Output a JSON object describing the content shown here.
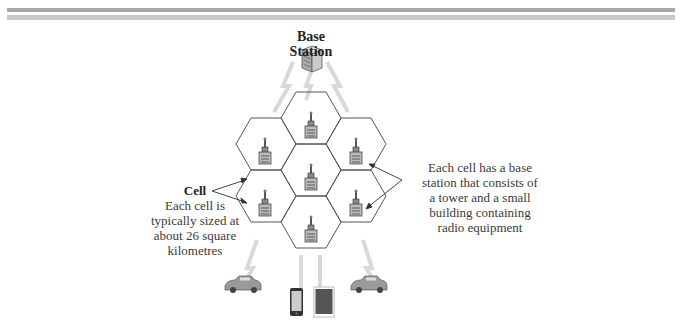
{
  "diagram": {
    "base_station": {
      "title_line1": "Base",
      "title_line2": "Station"
    },
    "cell_callout": {
      "title": "Cell",
      "lines": [
        "Each cell is",
        "typically sized at",
        "about 26 square",
        "kilometres"
      ]
    },
    "tower_callout": {
      "lines": [
        "Each cell has a base",
        "station that consists of",
        "a tower and a small",
        "building containing",
        "radio equipment"
      ]
    },
    "cells": 7,
    "devices": [
      "car-left",
      "smartphone",
      "tablet",
      "car-right"
    ],
    "colors": {
      "hex_stroke": "#555555",
      "signal": "#d4d4d4",
      "header_bar_1": "#a8a8a8",
      "header_bar_2": "#c8c8c8"
    }
  }
}
